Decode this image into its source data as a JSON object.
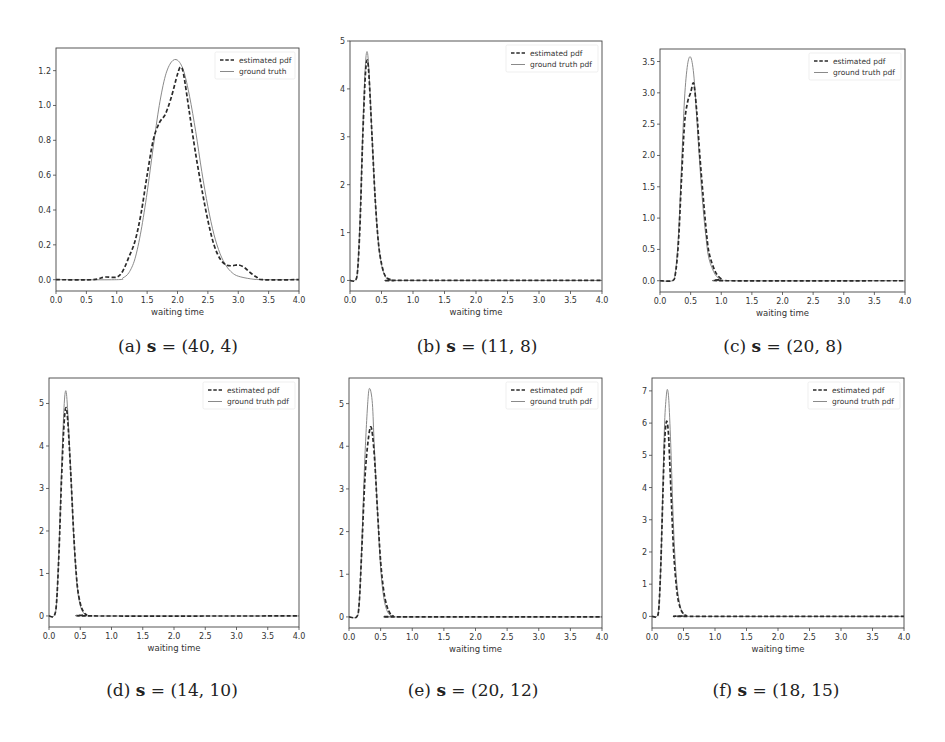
{
  "figure": {
    "panels": [
      {
        "id": "a",
        "caption_prefix": "(a) ",
        "caption_var": "s",
        "caption_eq": " = (40, 4)"
      },
      {
        "id": "b",
        "caption_prefix": "(b) ",
        "caption_var": "s",
        "caption_eq": " = (11, 8)"
      },
      {
        "id": "c",
        "caption_prefix": "(c) ",
        "caption_var": "s",
        "caption_eq": " = (20, 8)"
      },
      {
        "id": "d",
        "caption_prefix": "(d) ",
        "caption_var": "s",
        "caption_eq": " = (14, 10)"
      },
      {
        "id": "e",
        "caption_prefix": "(e) ",
        "caption_var": "s",
        "caption_eq": " = (20, 12)"
      },
      {
        "id": "f",
        "caption_prefix": "(f) ",
        "caption_var": "s",
        "caption_eq": " = (18, 15)"
      }
    ]
  },
  "chart_data": [
    {
      "type": "line",
      "title": "(a) s = (40, 4)",
      "xlabel": "waiting time",
      "ylabel": "",
      "xlim": [
        0.0,
        4.0
      ],
      "ylim": [
        -0.065,
        1.33
      ],
      "xticks": [
        "0.0",
        "0.5",
        "1.0",
        "1.5",
        "2.0",
        "2.5",
        "3.0",
        "3.5",
        "4.0"
      ],
      "yticks": [
        0.0,
        0.2,
        0.4,
        0.6,
        0.8,
        1.0,
        1.2
      ],
      "yticklabels": [
        "0.0",
        "0.2",
        "0.4",
        "0.6",
        "0.8",
        "1.0",
        "1.2"
      ],
      "legend": [
        "estimated pdf",
        "ground truth"
      ],
      "legend_position": "upper right",
      "grid": false,
      "box": {
        "left": 56,
        "top": 48,
        "right": 299,
        "bottom": 291
      },
      "series": [
        {
          "name": "estimated pdf",
          "style": "dashed",
          "x": [
            0.0,
            0.6,
            0.8,
            1.0,
            1.1,
            1.2,
            1.3,
            1.4,
            1.5,
            1.6,
            1.7,
            1.8,
            1.9,
            2.0,
            2.05,
            2.1,
            2.2,
            2.3,
            2.4,
            2.5,
            2.6,
            2.7,
            2.8,
            2.9,
            3.0,
            3.1,
            3.2,
            3.3,
            3.4,
            4.0
          ],
          "y": [
            0.0,
            0.0,
            0.015,
            0.015,
            0.05,
            0.13,
            0.22,
            0.38,
            0.6,
            0.8,
            0.9,
            0.95,
            1.05,
            1.18,
            1.22,
            1.18,
            0.95,
            0.72,
            0.52,
            0.34,
            0.2,
            0.12,
            0.085,
            0.08,
            0.085,
            0.07,
            0.04,
            0.015,
            0.0,
            0.0
          ]
        },
        {
          "name": "ground truth",
          "style": "solid",
          "x": [
            0.0,
            1.0,
            1.1,
            1.2,
            1.3,
            1.4,
            1.5,
            1.6,
            1.7,
            1.8,
            1.9,
            2.0,
            2.1,
            2.2,
            2.3,
            2.4,
            2.5,
            2.6,
            2.7,
            2.8,
            2.9,
            3.0,
            3.2,
            3.4,
            4.0
          ],
          "y": [
            0.0,
            0.0,
            0.01,
            0.04,
            0.12,
            0.28,
            0.5,
            0.76,
            1.0,
            1.17,
            1.25,
            1.26,
            1.2,
            1.05,
            0.85,
            0.62,
            0.42,
            0.26,
            0.15,
            0.08,
            0.04,
            0.02,
            0.005,
            0.0,
            0.0
          ]
        }
      ]
    },
    {
      "type": "line",
      "title": "(b) s = (11, 8)",
      "xlabel": "waiting time",
      "ylabel": "",
      "xlim": [
        0.0,
        4.0
      ],
      "ylim": [
        -0.22,
        5.0
      ],
      "xticks": [
        "0.0",
        "0.5",
        "1.0",
        "1.5",
        "2.0",
        "2.5",
        "3.0",
        "3.5",
        "4.0"
      ],
      "yticks": [
        0,
        1,
        2,
        3,
        4,
        5
      ],
      "yticklabels": [
        "0",
        "1",
        "2",
        "3",
        "4",
        "5"
      ],
      "legend": [
        "estimated pdf",
        "ground truth pdf"
      ],
      "legend_position": "upper right",
      "grid": false,
      "box": {
        "left": 350,
        "top": 41,
        "right": 602,
        "bottom": 291
      },
      "series": [
        {
          "name": "estimated pdf",
          "style": "dashed",
          "x": [
            0.0,
            0.08,
            0.12,
            0.16,
            0.2,
            0.24,
            0.27,
            0.3,
            0.35,
            0.4,
            0.45,
            0.5,
            0.55,
            0.6,
            0.7,
            0.8,
            4.0
          ],
          "y": [
            0.0,
            0.0,
            0.2,
            1.2,
            2.9,
            4.2,
            4.6,
            4.3,
            3.0,
            1.7,
            0.8,
            0.35,
            0.12,
            0.04,
            0.0,
            0.0,
            0.0
          ]
        },
        {
          "name": "ground truth pdf",
          "style": "solid",
          "x": [
            0.0,
            0.08,
            0.12,
            0.16,
            0.2,
            0.24,
            0.27,
            0.3,
            0.35,
            0.4,
            0.45,
            0.5,
            0.55,
            0.6,
            0.7,
            0.8,
            4.0
          ],
          "y": [
            0.0,
            0.0,
            0.2,
            1.3,
            3.0,
            4.4,
            4.78,
            4.4,
            3.0,
            1.7,
            0.8,
            0.33,
            0.11,
            0.03,
            0.0,
            0.0,
            0.0
          ]
        }
      ]
    },
    {
      "type": "line",
      "title": "(c) s = (20, 8)",
      "xlabel": "waiting time",
      "ylabel": "",
      "xlim": [
        0.0,
        4.0
      ],
      "ylim": [
        -0.18,
        3.7
      ],
      "xticks": [
        "0.0",
        "0.5",
        "1.0",
        "1.5",
        "2.0",
        "2.5",
        "3.0",
        "3.5",
        "4.0"
      ],
      "yticks": [
        0.0,
        0.5,
        1.0,
        1.5,
        2.0,
        2.5,
        3.0,
        3.5
      ],
      "yticklabels": [
        "0.0",
        "0.5",
        "1.0",
        "1.5",
        "2.0",
        "2.5",
        "3.0",
        "3.5"
      ],
      "legend": [
        "estimated pdf",
        "ground truth pdf"
      ],
      "legend_position": "upper right",
      "grid": false,
      "box": {
        "left": 660,
        "top": 49,
        "right": 905,
        "bottom": 292
      },
      "series": [
        {
          "name": "estimated pdf",
          "style": "dashed",
          "x": [
            0.0,
            0.2,
            0.25,
            0.3,
            0.35,
            0.4,
            0.45,
            0.5,
            0.55,
            0.6,
            0.65,
            0.7,
            0.75,
            0.8,
            0.9,
            1.0,
            1.1,
            4.0
          ],
          "y": [
            0.0,
            0.0,
            0.1,
            0.6,
            1.6,
            2.5,
            2.85,
            3.0,
            3.15,
            2.7,
            2.0,
            1.4,
            0.85,
            0.45,
            0.15,
            0.03,
            0.0,
            0.0
          ]
        },
        {
          "name": "ground truth pdf",
          "style": "solid",
          "x": [
            0.0,
            0.2,
            0.25,
            0.3,
            0.35,
            0.4,
            0.45,
            0.5,
            0.55,
            0.6,
            0.65,
            0.7,
            0.75,
            0.8,
            0.9,
            1.0,
            1.1,
            4.0
          ],
          "y": [
            0.0,
            0.0,
            0.12,
            0.7,
            1.8,
            2.9,
            3.45,
            3.57,
            3.3,
            2.6,
            1.85,
            1.2,
            0.7,
            0.35,
            0.1,
            0.02,
            0.0,
            0.0
          ]
        }
      ]
    },
    {
      "type": "line",
      "title": "(d) s = (14, 10)",
      "xlabel": "waiting time",
      "ylabel": "",
      "xlim": [
        0.0,
        4.0
      ],
      "ylim": [
        -0.26,
        5.6
      ],
      "xticks": [
        "0.0",
        "0.5",
        "1.0",
        "1.5",
        "2.0",
        "2.5",
        "3.0",
        "3.5",
        "4.0"
      ],
      "yticks": [
        0,
        1,
        2,
        3,
        4,
        5
      ],
      "yticklabels": [
        "0",
        "1",
        "2",
        "3",
        "4",
        "5"
      ],
      "legend": [
        "estimated pdf",
        "ground truth pdf"
      ],
      "legend_position": "upper right",
      "grid": false,
      "box": {
        "left": 49,
        "top": 378,
        "right": 299,
        "bottom": 627
      },
      "series": [
        {
          "name": "estimated pdf",
          "style": "dashed",
          "x": [
            0.0,
            0.08,
            0.12,
            0.16,
            0.2,
            0.24,
            0.27,
            0.3,
            0.35,
            0.4,
            0.45,
            0.5,
            0.55,
            0.6,
            0.7,
            4.0
          ],
          "y": [
            0.0,
            0.0,
            0.3,
            1.5,
            3.2,
            4.5,
            4.9,
            4.6,
            3.3,
            1.8,
            0.75,
            0.3,
            0.1,
            0.03,
            0.0,
            0.0
          ]
        },
        {
          "name": "ground truth pdf",
          "style": "solid",
          "x": [
            0.0,
            0.08,
            0.12,
            0.16,
            0.2,
            0.24,
            0.27,
            0.3,
            0.35,
            0.4,
            0.45,
            0.5,
            0.55,
            0.6,
            0.7,
            4.0
          ],
          "y": [
            0.0,
            0.0,
            0.3,
            1.6,
            3.4,
            4.9,
            5.3,
            4.8,
            3.3,
            1.75,
            0.7,
            0.25,
            0.08,
            0.02,
            0.0,
            0.0
          ]
        }
      ]
    },
    {
      "type": "line",
      "title": "(e) s = (20, 12)",
      "xlabel": "waiting time",
      "ylabel": "",
      "xlim": [
        0.0,
        4.0
      ],
      "ylim": [
        -0.26,
        5.6
      ],
      "xticks": [
        "0.0",
        "0.5",
        "1.0",
        "1.5",
        "2.0",
        "2.5",
        "3.0",
        "3.5",
        "4.0"
      ],
      "yticks": [
        0,
        1,
        2,
        3,
        4,
        5
      ],
      "yticklabels": [
        "0",
        "1",
        "2",
        "3",
        "4",
        "5"
      ],
      "legend": [
        "estimated pdf",
        "ground truth pdf"
      ],
      "legend_position": "upper right",
      "grid": false,
      "box": {
        "left": 349,
        "top": 378,
        "right": 602,
        "bottom": 628
      },
      "series": [
        {
          "name": "estimated pdf",
          "style": "dashed",
          "x": [
            0.0,
            0.12,
            0.16,
            0.2,
            0.25,
            0.3,
            0.35,
            0.4,
            0.45,
            0.5,
            0.55,
            0.6,
            0.65,
            0.7,
            0.8,
            4.0
          ],
          "y": [
            0.0,
            0.0,
            0.3,
            1.5,
            3.2,
            4.1,
            4.45,
            3.8,
            2.5,
            1.3,
            0.6,
            0.25,
            0.08,
            0.02,
            0.0,
            0.0
          ]
        },
        {
          "name": "ground truth pdf",
          "style": "solid",
          "x": [
            0.0,
            0.12,
            0.16,
            0.2,
            0.25,
            0.3,
            0.33,
            0.37,
            0.4,
            0.45,
            0.5,
            0.55,
            0.6,
            0.65,
            0.7,
            0.8,
            4.0
          ],
          "y": [
            0.0,
            0.0,
            0.3,
            1.6,
            3.7,
            5.1,
            5.35,
            5.0,
            4.0,
            2.5,
            1.15,
            0.45,
            0.15,
            0.04,
            0.01,
            0.0,
            0.0
          ]
        }
      ]
    },
    {
      "type": "line",
      "title": "(f) s = (18, 15)",
      "xlabel": "waiting time",
      "ylabel": "",
      "xlim": [
        0.0,
        4.0
      ],
      "ylim": [
        -0.36,
        7.4
      ],
      "xticks": [
        "0.0",
        "0.5",
        "1.0",
        "1.5",
        "2.0",
        "2.5",
        "3.0",
        "3.5",
        "4.0"
      ],
      "yticks": [
        0,
        1,
        2,
        3,
        4,
        5,
        6,
        7
      ],
      "yticklabels": [
        "0",
        "1",
        "2",
        "3",
        "4",
        "5",
        "6",
        "7"
      ],
      "legend": [
        "estimated pdf",
        "ground truth pdf"
      ],
      "legend_position": "upper right",
      "grid": false,
      "box": {
        "left": 652,
        "top": 378,
        "right": 904,
        "bottom": 628
      },
      "series": [
        {
          "name": "estimated pdf",
          "style": "dashed",
          "x": [
            0.0,
            0.08,
            0.11,
            0.14,
            0.17,
            0.2,
            0.23,
            0.26,
            0.29,
            0.32,
            0.35,
            0.4,
            0.45,
            0.5,
            0.55,
            0.6,
            4.0
          ],
          "y": [
            0.0,
            0.0,
            0.3,
            1.6,
            3.6,
            5.4,
            6.05,
            5.7,
            4.4,
            3.0,
            1.8,
            0.7,
            0.25,
            0.08,
            0.02,
            0.0,
            0.0
          ]
        },
        {
          "name": "ground truth pdf",
          "style": "solid",
          "x": [
            0.0,
            0.08,
            0.11,
            0.14,
            0.17,
            0.2,
            0.23,
            0.25,
            0.27,
            0.3,
            0.33,
            0.36,
            0.4,
            0.45,
            0.5,
            0.55,
            0.6,
            4.0
          ],
          "y": [
            0.0,
            0.0,
            0.3,
            1.6,
            3.8,
            6.0,
            6.9,
            7.02,
            6.6,
            5.2,
            3.4,
            2.0,
            0.9,
            0.3,
            0.08,
            0.02,
            0.0,
            0.0
          ]
        }
      ]
    }
  ]
}
